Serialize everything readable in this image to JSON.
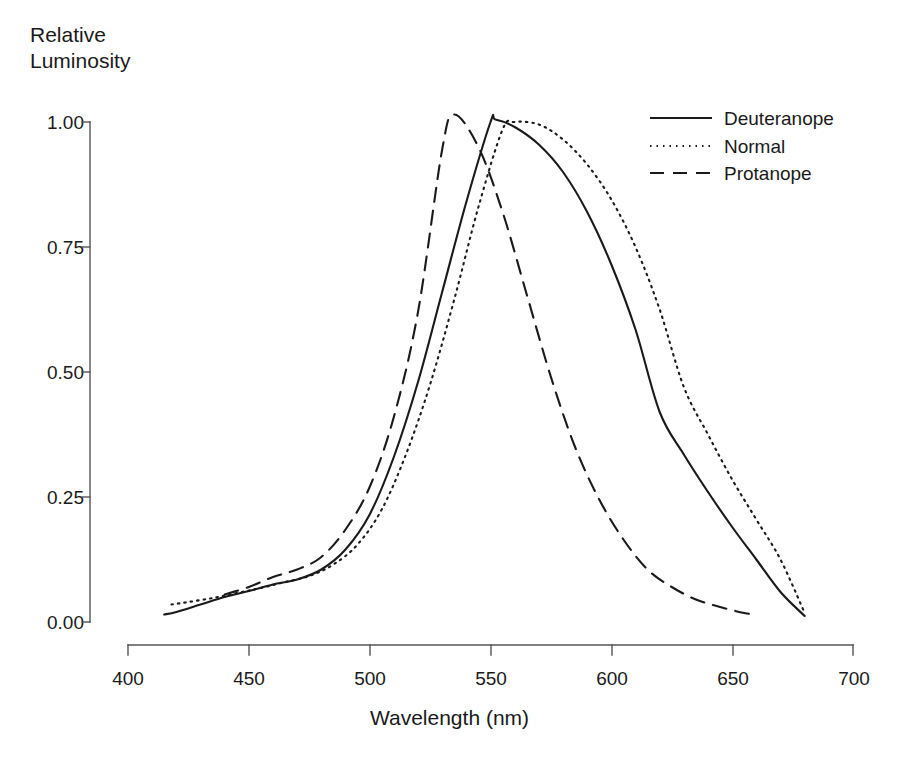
{
  "chart_data": {
    "type": "line",
    "title": "",
    "xlabel": "Wavelength (nm)",
    "ylabel": "Relative\nLuminosity",
    "xlim": [
      400,
      700
    ],
    "ylim": [
      0.0,
      1.0
    ],
    "xticks": [
      400,
      450,
      500,
      550,
      600,
      650,
      700
    ],
    "xtick_labels": [
      "400",
      "450",
      "500",
      "550",
      "600",
      "650",
      "700"
    ],
    "yticks": [
      0.0,
      0.25,
      0.5,
      0.75,
      1.0
    ],
    "ytick_labels": [
      "0.00",
      "0.25",
      "0.50",
      "0.75",
      "1.00"
    ],
    "grid": false,
    "legend_position": "upper right",
    "legend_entries": [
      "Deuteranope",
      "Normal",
      "Protanope"
    ],
    "series": [
      {
        "name": "Deuteranope",
        "style": "solid",
        "color": "#1a1a1a",
        "x": [
          415,
          420,
          430,
          440,
          450,
          460,
          470,
          480,
          490,
          500,
          510,
          520,
          530,
          540,
          550,
          552,
          560,
          570,
          580,
          590,
          600,
          610,
          620,
          630,
          640,
          650,
          660,
          670,
          680
        ],
        "y": [
          0.015,
          0.02,
          0.035,
          0.05,
          0.062,
          0.075,
          0.085,
          0.105,
          0.145,
          0.215,
          0.33,
          0.48,
          0.66,
          0.84,
          1.0,
          1.005,
          0.99,
          0.955,
          0.9,
          0.82,
          0.715,
          0.585,
          0.42,
          0.335,
          0.26,
          0.19,
          0.125,
          0.06,
          0.012
        ]
      },
      {
        "name": "Normal",
        "style": "dotted",
        "color": "#1a1a1a",
        "x": [
          418,
          425,
          435,
          445,
          455,
          465,
          475,
          485,
          495,
          505,
          515,
          525,
          535,
          545,
          555,
          560,
          570,
          580,
          590,
          600,
          610,
          620,
          630,
          640,
          650,
          660,
          670,
          680
        ],
        "y": [
          0.035,
          0.04,
          0.048,
          0.058,
          0.068,
          0.08,
          0.092,
          0.115,
          0.155,
          0.225,
          0.335,
          0.475,
          0.645,
          0.83,
          0.985,
          1.0,
          0.995,
          0.965,
          0.915,
          0.845,
          0.75,
          0.625,
          0.47,
          0.375,
          0.285,
          0.205,
          0.125,
          0.018
        ]
      },
      {
        "name": "Protanope",
        "style": "dashed",
        "color": "#1a1a1a",
        "x": [
          440,
          450,
          460,
          470,
          480,
          490,
          500,
          510,
          520,
          530,
          535,
          545,
          555,
          565,
          575,
          585,
          595,
          605,
          615,
          625,
          635,
          645,
          655,
          660
        ],
        "y": [
          0.055,
          0.07,
          0.09,
          0.105,
          0.13,
          0.185,
          0.27,
          0.41,
          0.62,
          0.945,
          1.015,
          0.95,
          0.82,
          0.655,
          0.49,
          0.35,
          0.245,
          0.165,
          0.105,
          0.07,
          0.045,
          0.03,
          0.018,
          0.015
        ]
      }
    ]
  },
  "axes": {
    "x_axis_name": "wavelength-axis",
    "y_axis_name": "luminosity-axis"
  }
}
